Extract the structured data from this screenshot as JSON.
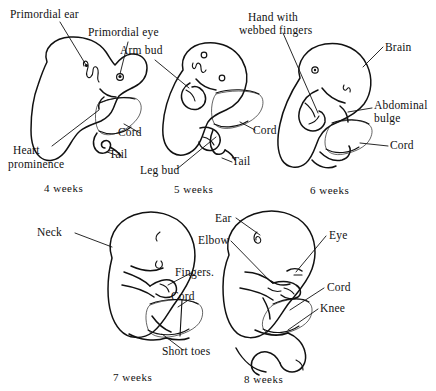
{
  "figure": {
    "background_color": "#ffffff",
    "ink_color": "#111111"
  },
  "stages": [
    {
      "id": "stage-4-weeks",
      "caption": "4 weeks",
      "labels": [
        {
          "name": "primordial-ear",
          "text": "Primordial ear"
        },
        {
          "name": "primordial-eye",
          "text": "Primordial eye"
        },
        {
          "name": "cord",
          "text": "Cord"
        },
        {
          "name": "tail",
          "text": "Tail"
        },
        {
          "name": "heart-prominence-line1",
          "text": "Heart"
        },
        {
          "name": "heart-prominence-line2",
          "text": "prominence"
        }
      ]
    },
    {
      "id": "stage-5-weeks",
      "caption": "5 weeks",
      "labels": [
        {
          "name": "arm-bud",
          "text": "Arm bud"
        },
        {
          "name": "cord",
          "text": "Cord"
        },
        {
          "name": "tail",
          "text": "Tail"
        },
        {
          "name": "leg-bud",
          "text": "Leg bud"
        }
      ]
    },
    {
      "id": "stage-6-weeks",
      "caption": "6 weeks",
      "labels": [
        {
          "name": "hand-webbed-fingers-line1",
          "text": "Hand with"
        },
        {
          "name": "hand-webbed-fingers-line2",
          "text": "webbed fingers"
        },
        {
          "name": "brain",
          "text": "Brain"
        },
        {
          "name": "abdominal-bulge-line1",
          "text": "Abdominal"
        },
        {
          "name": "abdominal-bulge-line2",
          "text": "bulge"
        },
        {
          "name": "cord",
          "text": "Cord"
        }
      ]
    },
    {
      "id": "stage-7-weeks",
      "caption": "7 weeks",
      "labels": [
        {
          "name": "neck",
          "text": "Neck"
        },
        {
          "name": "fingers",
          "text": "Fingers."
        },
        {
          "name": "cord",
          "text": "Cord"
        },
        {
          "name": "short-toes",
          "text": "Short toes"
        }
      ]
    },
    {
      "id": "stage-8-weeks",
      "caption": "8 weeks",
      "labels": [
        {
          "name": "ear",
          "text": "Ear"
        },
        {
          "name": "elbow",
          "text": "Elbow"
        },
        {
          "name": "eye",
          "text": "Eye"
        },
        {
          "name": "cord",
          "text": "Cord"
        },
        {
          "name": "knee",
          "text": "Knee"
        }
      ]
    }
  ]
}
